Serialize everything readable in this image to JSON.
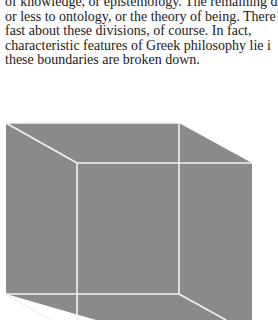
{
  "text": {
    "lines": [
      "of knowledge, or epistemology. The remaining di",
      "or less to ontology, or the theory of being. There",
      "fast about these divisions, of course. In fact,",
      "characteristic features of Greek philosophy lie i",
      "these boundaries are broken down."
    ]
  },
  "figure": {
    "name": "necker-cube-illustration",
    "fill": "#8a8a8a",
    "edge_color": "#f2f2f2"
  }
}
